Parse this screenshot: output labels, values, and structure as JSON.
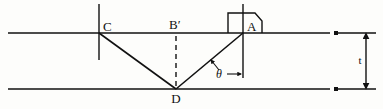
{
  "figure": {
    "kind": "optics-ray-diagram",
    "background_color": "#fdfdfb",
    "stroke_color": "#111111"
  },
  "labels": {
    "point_c": "C",
    "point_b_prime": "B′",
    "point_a": "A",
    "point_d": "D",
    "angle_theta": "θ",
    "thickness_t": "t"
  },
  "geometry": {
    "top_surface": {
      "y": 33,
      "x1": 8,
      "x2": 330
    },
    "bottom_surface": {
      "y": 89,
      "x1": 8,
      "x2": 330
    },
    "point_a": {
      "x": 243,
      "y": 33
    },
    "point_b_prime": {
      "x": 176,
      "y": 33
    },
    "point_c": {
      "x": 99,
      "y": 33
    },
    "point_d": {
      "x": 176,
      "y": 89
    },
    "tick_c": {
      "x": 99,
      "y1": 4,
      "y2": 60
    },
    "tick_a": {
      "x": 243,
      "y1": 4,
      "y2": 78
    },
    "dashed_normal": {
      "x": 176,
      "y1": 36,
      "y2": 87
    },
    "thickness_dim": {
      "x": 366,
      "y1": 33,
      "y2": 89
    },
    "dim_ext_top": {
      "y": 33,
      "x1": 336,
      "x2": 376
    },
    "dim_ext_bottom": {
      "y": 89,
      "x1": 336,
      "x2": 376
    },
    "detector_box": {
      "x": 228,
      "y": 13,
      "width": 34,
      "height": 20,
      "chamfer": 7
    }
  },
  "annotations": {
    "incoming_ray": "A to D",
    "outgoing_ray": "D to C",
    "angle_marked_between": "incident ray AD and the normal at A"
  }
}
